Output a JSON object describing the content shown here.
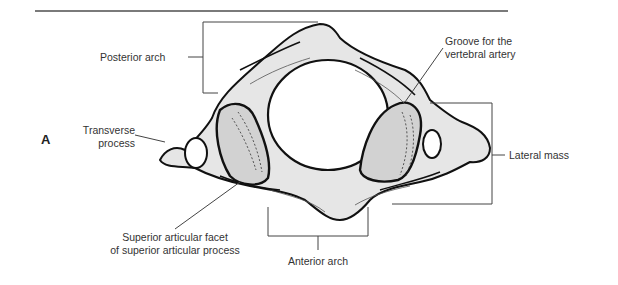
{
  "figure": {
    "panel_letter": "A",
    "labels": {
      "posterior_arch": "Posterior arch",
      "groove_line1": "Groove for the",
      "groove_line2": "vertebral artery",
      "transverse_line1": "Transverse",
      "transverse_line2": "process",
      "lateral_mass": "Lateral mass",
      "superior_facet_line1": "Superior articular facet",
      "superior_facet_line2": "of superior articular process",
      "anterior_arch": "Anterior arch"
    }
  },
  "colors": {
    "bone_fill": "#e6e6e6",
    "outline": "#111111",
    "leader": "#444444",
    "rule": "#7a7a7a"
  }
}
